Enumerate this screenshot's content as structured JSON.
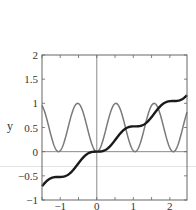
{
  "chart_data": {
    "type": "line",
    "title": "",
    "xlabel": "",
    "ylabel": "y",
    "xlim": [
      -1.5,
      2.47
    ],
    "ylim": [
      -1,
      2
    ],
    "grid": false,
    "legend": null,
    "x_ticks": [
      -1,
      0,
      1,
      2
    ],
    "x_tick_labels": [
      "−1",
      "0",
      "1",
      "2"
    ],
    "y_ticks": [
      2,
      1.5,
      1,
      0.5,
      0,
      -0.5,
      -1
    ],
    "y_tick_labels": [
      "2",
      "1.5",
      "1",
      "0.5",
      "0",
      "−0.5",
      "−1"
    ],
    "axes_lines": {
      "x_zero": true,
      "y_zero": true
    },
    "series": [
      {
        "name": "sin^2(3x)",
        "style": "thin gray",
        "color": "#7a7a7a",
        "x": [
          -1.5,
          -1.25,
          -1.047,
          -0.785,
          -0.524,
          -0.262,
          0,
          0.262,
          0.524,
          0.785,
          1.047,
          1.309,
          1.571,
          1.833,
          2.094,
          2.356,
          2.47
        ],
        "values": [
          0.96,
          0.32,
          0.0,
          0.5,
          1.0,
          0.5,
          0.0,
          0.5,
          1.0,
          0.5,
          0.0,
          0.5,
          1.0,
          0.5,
          0.0,
          0.5,
          0.89
        ]
      },
      {
        "name": "x/2 - sin(6x)/12",
        "style": "thick black",
        "color": "#1a1a1a",
        "x": [
          -1.5,
          -1.25,
          -1.0,
          -0.75,
          -0.5,
          -0.25,
          0,
          0.25,
          0.5,
          0.75,
          1.0,
          1.25,
          1.5,
          1.75,
          2.0,
          2.25,
          2.47
        ],
        "values": [
          -0.72,
          -0.54,
          -0.52,
          -0.46,
          -0.26,
          -0.04,
          0.0,
          0.04,
          0.26,
          0.46,
          0.52,
          0.54,
          0.72,
          0.95,
          1.04,
          1.07,
          1.2
        ]
      }
    ]
  },
  "axis": {
    "ylabel": "y"
  }
}
